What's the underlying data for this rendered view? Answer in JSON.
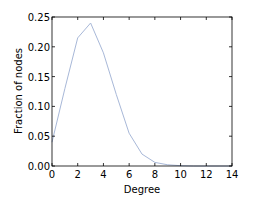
{
  "chart_data": {
    "type": "line",
    "title": "",
    "xlabel": "Degree",
    "ylabel": "Fraction of nodes",
    "xlim": [
      0,
      14
    ],
    "ylim": [
      0.0,
      0.25
    ],
    "xticks": [
      "0",
      "2",
      "4",
      "6",
      "8",
      "10",
      "12",
      "14"
    ],
    "yticks": [
      "0.00",
      "0.05",
      "0.10",
      "0.15",
      "0.20",
      "0.25"
    ],
    "grid": false,
    "legend": null,
    "series": [
      {
        "name": "degree distribution",
        "color": "#a8b8d8",
        "x": [
          0,
          1,
          2,
          3,
          4,
          5,
          6,
          7,
          8,
          9,
          10,
          11,
          12,
          13,
          14
        ],
        "values": [
          0.04,
          0.13,
          0.215,
          0.24,
          0.19,
          0.12,
          0.055,
          0.02,
          0.006,
          0.002,
          0.0005,
          0.0,
          0.0,
          0.0,
          0.0
        ]
      }
    ]
  }
}
